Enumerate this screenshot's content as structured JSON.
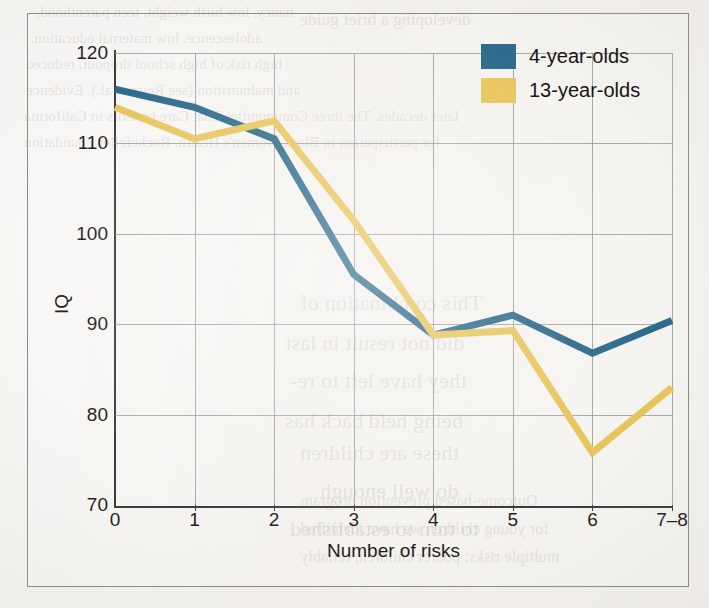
{
  "chart_data": {
    "type": "line",
    "title": "",
    "xlabel": "Number of risks",
    "ylabel": "IQ",
    "categories": [
      "0",
      "1",
      "2",
      "3",
      "4",
      "5",
      "6",
      "7–8"
    ],
    "x_tick_labels": [
      "0",
      "1",
      "2",
      "3",
      "4",
      "5",
      "6",
      "7–8"
    ],
    "y_tick_labels": [
      "70",
      "80",
      "90",
      "100",
      "110",
      "120"
    ],
    "ylim": [
      70,
      120
    ],
    "y_ticks": [
      70,
      80,
      90,
      100,
      110,
      120
    ],
    "grid": true,
    "legend_position": "top-right",
    "series": [
      {
        "name": "4-year-olds",
        "color": "#2e6b8c",
        "values": [
          116.0,
          114.0,
          110.5,
          95.5,
          88.8,
          91.0,
          86.8,
          90.4
        ]
      },
      {
        "name": "13-year-olds",
        "color": "#e8c55d",
        "values": [
          114.0,
          110.5,
          112.5,
          101.5,
          88.8,
          89.3,
          75.8,
          83.0
        ]
      }
    ]
  },
  "legend": {
    "items": [
      {
        "label": "4-year-olds",
        "color": "#2e6b8c"
      },
      {
        "label": "13-year-olds",
        "color": "#e8c55d"
      }
    ]
  },
  "axes": {
    "x_title": "Number of risks",
    "y_title": "IQ"
  },
  "background_text": [
    {
      "text": "nancy, low birth weight, teen parenthood,",
      "x": 36,
      "y": 4,
      "size": 15
    },
    {
      "text": "adolescence, low maternal education,",
      "x": 30,
      "y": 30,
      "size": 15
    },
    {
      "text": "high risk of high school dropout, reduced",
      "x": 26,
      "y": 56,
      "size": 15
    },
    {
      "text": "and malnutrition (see Reiss et al.). Evidence",
      "x": 26,
      "y": 82,
      "size": 15
    },
    {
      "text": "later decades. The three Communities That Care benefits in California",
      "x": 24,
      "y": 108,
      "size": 15
    },
    {
      "text": "for participation in Black Women's Health. Rockefeller Foundation",
      "x": 24,
      "y": 134,
      "size": 15
    },
    {
      "text": "This combination of",
      "x": 300,
      "y": 290,
      "size": 22
    },
    {
      "text": "did not result in last",
      "x": 285,
      "y": 330,
      "size": 22
    },
    {
      "text": "they have left to re-",
      "x": 290,
      "y": 368,
      "size": 22
    },
    {
      "text": "being held back has",
      "x": 285,
      "y": 408,
      "size": 22
    },
    {
      "text": "these are children",
      "x": 300,
      "y": 440,
      "size": 22
    },
    {
      "text": "do well enough",
      "x": 320,
      "y": 478,
      "size": 22
    },
    {
      "text": "to turn to established",
      "x": 290,
      "y": 516,
      "size": 22
    },
    {
      "text": "developing a brief guide",
      "x": 300,
      "y": 10,
      "size": 17
    },
    {
      "text": "Outcome-based prevention program",
      "x": 300,
      "y": 492,
      "size": 16
    },
    {
      "text": "for young children we have identified",
      "x": 300,
      "y": 520,
      "size": 16
    },
    {
      "text": "multiple risks: poorer children, reliably",
      "x": 300,
      "y": 548,
      "size": 16
    }
  ]
}
